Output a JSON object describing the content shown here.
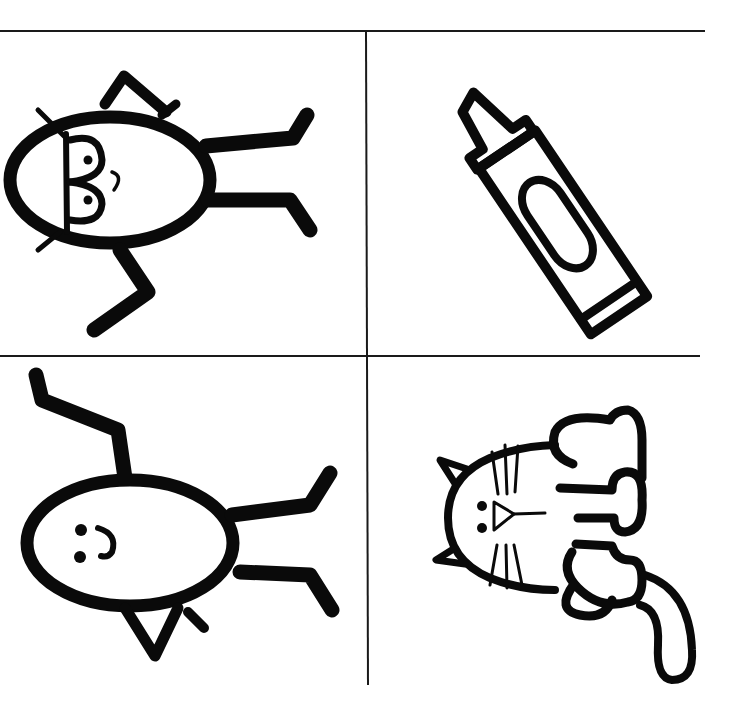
{
  "page": {
    "background": "#ffffff",
    "ink_color": "#0a0a0a"
  },
  "grid": {
    "rows": 2,
    "columns": 2,
    "cells": [
      {
        "position": "top-left",
        "subject": "Boy with glasses (stick figure)"
      },
      {
        "position": "top-right",
        "subject": "Crayon"
      },
      {
        "position": "bottom-left",
        "subject": "Girl smiling (stick figure)"
      },
      {
        "position": "bottom-right",
        "subject": "Cat sitting"
      }
    ]
  }
}
